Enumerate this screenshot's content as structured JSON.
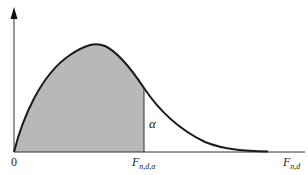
{
  "diagram": {
    "type": "F-distribution density with critical value",
    "colors": {
      "curve": "#1a1a1a",
      "shade": "#b8b8b8",
      "axis": "#333333"
    },
    "labels": {
      "origin": "0",
      "critical_main": "F",
      "critical_sub": "n,d,α",
      "axis_main": "F",
      "axis_sub": "n,d",
      "alpha": "α"
    }
  }
}
